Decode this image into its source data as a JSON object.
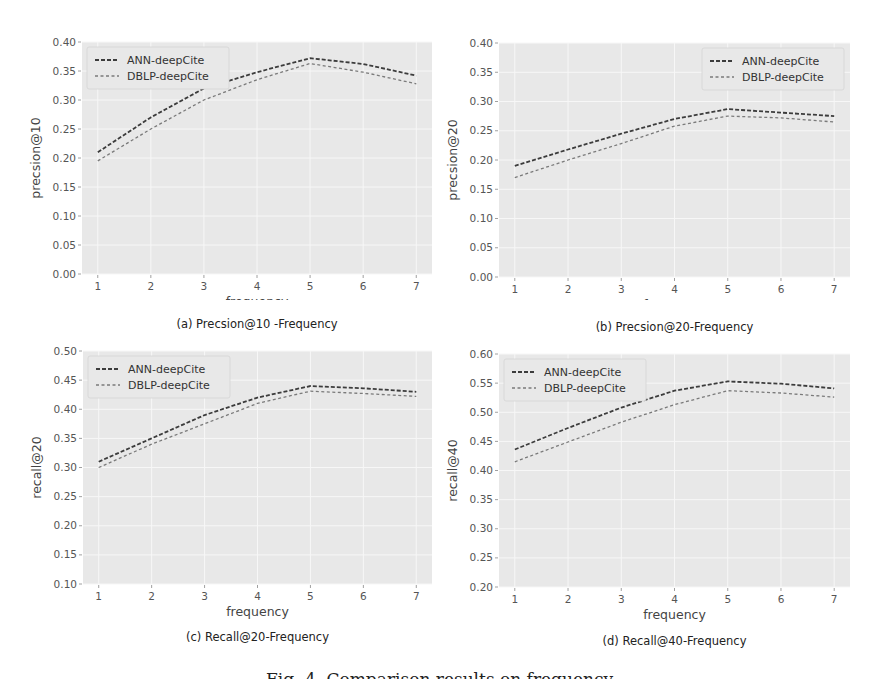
{
  "legend": {
    "series_a": "ANN-deepCite",
    "series_b": "DBLP-deepCite"
  },
  "colors": {
    "plot_bg": "#e8e8e8",
    "grid": "#f7f7f7",
    "series_a": "#3c3c3c",
    "series_b": "#7a7a7a"
  },
  "figure_caption": "Fig. 4. Comparison results on frequency",
  "chart_data": [
    {
      "type": "line",
      "caption": "(a) Precsion@10 -Frequency",
      "xlabel": "frequency",
      "ylabel": "precsion@10",
      "x": [
        1,
        2,
        3,
        4,
        5,
        6,
        7
      ],
      "ylim": [
        0.0,
        0.4
      ],
      "yticks": [
        "0.00",
        "0.05",
        "0.10",
        "0.15",
        "0.20",
        "0.25",
        "0.30",
        "0.35",
        "0.40"
      ],
      "grid": true,
      "legend_position": "upper left",
      "series": [
        {
          "name": "ANN-deepCite",
          "values": [
            0.21,
            0.27,
            0.32,
            0.348,
            0.372,
            0.362,
            0.342
          ]
        },
        {
          "name": "DBLP-deepCite",
          "values": [
            0.195,
            0.25,
            0.3,
            0.335,
            0.363,
            0.348,
            0.328
          ]
        }
      ]
    },
    {
      "type": "line",
      "caption": "(b) Precsion@20-Frequency",
      "xlabel": "frequency",
      "ylabel": "precsion@20",
      "x": [
        1,
        2,
        3,
        4,
        5,
        6,
        7
      ],
      "ylim": [
        0.0,
        0.4
      ],
      "yticks": [
        "0.00",
        "0.05",
        "0.10",
        "0.15",
        "0.20",
        "0.25",
        "0.30",
        "0.35",
        "0.40"
      ],
      "grid": true,
      "legend_position": "upper right",
      "series": [
        {
          "name": "ANN-deepCite",
          "values": [
            0.19,
            0.218,
            0.245,
            0.27,
            0.287,
            0.281,
            0.275
          ]
        },
        {
          "name": "DBLP-deepCite",
          "values": [
            0.17,
            0.2,
            0.228,
            0.258,
            0.275,
            0.272,
            0.265
          ]
        }
      ]
    },
    {
      "type": "line",
      "caption": "(c) Recall@20-Frequency",
      "xlabel": "frequency",
      "ylabel": "recall@20",
      "x": [
        1,
        2,
        3,
        4,
        5,
        6,
        7
      ],
      "ylim": [
        0.1,
        0.5
      ],
      "yticks": [
        "0.10",
        "0.15",
        "0.20",
        "0.25",
        "0.30",
        "0.35",
        "0.40",
        "0.45",
        "0.50"
      ],
      "grid": true,
      "legend_position": "upper left",
      "series": [
        {
          "name": "ANN-deepCite",
          "values": [
            0.31,
            0.35,
            0.39,
            0.42,
            0.44,
            0.436,
            0.43
          ]
        },
        {
          "name": "DBLP-deepCite",
          "values": [
            0.3,
            0.34,
            0.375,
            0.41,
            0.431,
            0.427,
            0.422
          ]
        }
      ]
    },
    {
      "type": "line",
      "caption": "(d) Recall@40-Frequency",
      "xlabel": "frequency",
      "ylabel": "recall@40",
      "x": [
        1,
        2,
        3,
        4,
        5,
        6,
        7
      ],
      "ylim": [
        0.2,
        0.6
      ],
      "yticks": [
        "0.20",
        "0.25",
        "0.30",
        "0.35",
        "0.40",
        "0.45",
        "0.50",
        "0.55",
        "0.60"
      ],
      "grid": true,
      "legend_position": "upper left",
      "series": [
        {
          "name": "ANN-deepCite",
          "values": [
            0.436,
            0.473,
            0.508,
            0.537,
            0.553,
            0.549,
            0.541
          ]
        },
        {
          "name": "DBLP-deepCite",
          "values": [
            0.415,
            0.449,
            0.483,
            0.513,
            0.537,
            0.533,
            0.526
          ]
        }
      ]
    }
  ]
}
